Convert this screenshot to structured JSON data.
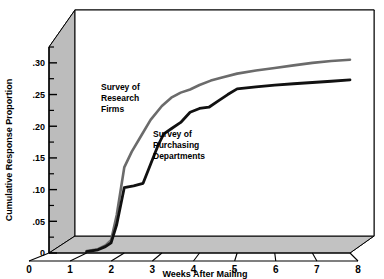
{
  "chart_data": {
    "type": "line",
    "title": "",
    "xlabel": "Weeks After Mailing",
    "ylabel": "Cumulative Response Proportion",
    "xlim": [
      0,
      8
    ],
    "ylim": [
      0,
      0.325
    ],
    "grid": false,
    "legend_position": "inline-annotations",
    "xticks": [
      "0",
      "1",
      "2",
      "3",
      "4",
      "5",
      "6",
      "7",
      "8"
    ],
    "xtick_values": [
      0,
      1,
      2,
      3,
      4,
      5,
      6,
      7,
      8
    ],
    "yticks": [
      "0",
      ".05",
      ".10",
      ".15",
      ".20",
      ".25",
      ".30"
    ],
    "ytick_values": [
      0,
      0.05,
      0.1,
      0.15,
      0.2,
      0.25,
      0.3
    ],
    "minor_yticks": [
      0.025,
      0.075,
      0.125,
      0.175,
      0.225,
      0.275,
      0.325
    ],
    "series": [
      {
        "name": "Survey of Research Firms",
        "color": "#6b6b6b",
        "annotation": "Survey of\nResearch\nFirms",
        "annotation_lines": [
          "Survey of",
          "Research",
          "Firms"
        ],
        "x": [
          1.0,
          1.3,
          1.5,
          1.65,
          1.8,
          2.0,
          2.2,
          2.45,
          2.7,
          3.0,
          3.25,
          3.5,
          3.75,
          4.0,
          4.3,
          4.6,
          5.0,
          5.5,
          6.0,
          6.5,
          7.0,
          7.5,
          8.0
        ],
        "y": [
          0.003,
          0.006,
          0.012,
          0.02,
          0.06,
          0.135,
          0.16,
          0.185,
          0.21,
          0.232,
          0.245,
          0.253,
          0.258,
          0.265,
          0.272,
          0.277,
          0.283,
          0.288,
          0.292,
          0.296,
          0.3,
          0.303,
          0.305
        ]
      },
      {
        "name": "Survey of Purchasing Departments",
        "color": "#111111",
        "annotation": "Survey of\nPurchasing\nDepartments",
        "annotation_lines": [
          "Survey of",
          "Purchasing",
          "Departments"
        ],
        "x": [
          1.0,
          1.3,
          1.5,
          1.65,
          1.8,
          2.0,
          2.25,
          2.5,
          2.7,
          2.9,
          3.05,
          3.25,
          3.5,
          3.75,
          4.0,
          4.25,
          4.5,
          4.75,
          5.0,
          5.5,
          6.0,
          6.5,
          7.0,
          7.5,
          8.0
        ],
        "y": [
          0.002,
          0.005,
          0.01,
          0.016,
          0.045,
          0.103,
          0.106,
          0.11,
          0.14,
          0.17,
          0.188,
          0.196,
          0.206,
          0.222,
          0.228,
          0.23,
          0.24,
          0.25,
          0.259,
          0.262,
          0.265,
          0.267,
          0.269,
          0.271,
          0.273
        ]
      }
    ]
  },
  "frame": {
    "top_face_color": "#e9e9e9",
    "side_face_color": "#bcbcbc",
    "floor_face_color": "#c2c2c2",
    "plot_bg_color": "#ffffff",
    "outline_color": "#000000"
  }
}
